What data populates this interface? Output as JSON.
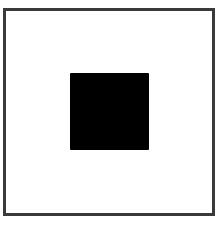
{
  "diagram": {
    "outer_frame": {
      "shape": "square-outline",
      "stroke_color": "#3a3a3a",
      "fill_color": "#ffffff"
    },
    "inner_square": {
      "shape": "filled-square",
      "fill_color": "#000000",
      "position": "center"
    }
  }
}
